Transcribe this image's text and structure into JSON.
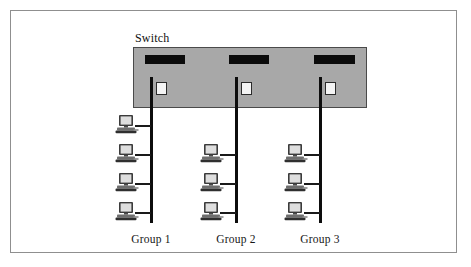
{
  "diagram": {
    "title": "Switch",
    "switch": {
      "label": "Switch",
      "box_color": "#a8a8a8",
      "slot_color": "#0b0b0b",
      "port_color": "#f4f4f4",
      "slots": [
        {
          "name": "switch-slot-1"
        },
        {
          "name": "switch-slot-2"
        },
        {
          "name": "switch-slot-3"
        }
      ],
      "ports": [
        {
          "name": "switch-port-1"
        },
        {
          "name": "switch-port-2"
        },
        {
          "name": "switch-port-3"
        }
      ]
    },
    "groups": [
      {
        "label": "Group 1",
        "computer_count": 4,
        "computers": [
          {
            "name": "computer-g1-1"
          },
          {
            "name": "computer-g1-2"
          },
          {
            "name": "computer-g1-3"
          },
          {
            "name": "computer-g1-4"
          }
        ]
      },
      {
        "label": "Group 2",
        "computer_count": 3,
        "computers": [
          {
            "name": "computer-g2-1"
          },
          {
            "name": "computer-g2-2"
          },
          {
            "name": "computer-g2-3"
          }
        ]
      },
      {
        "label": "Group 3",
        "computer_count": 3,
        "computers": [
          {
            "name": "computer-g3-1"
          },
          {
            "name": "computer-g3-2"
          },
          {
            "name": "computer-g3-3"
          }
        ]
      }
    ],
    "cable_color": "#0d0d0d",
    "frame_color": "#8f8f8f",
    "background_color": "#ffffff"
  }
}
